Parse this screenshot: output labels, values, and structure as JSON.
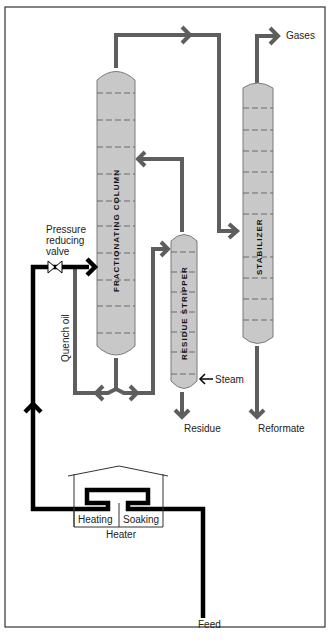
{
  "diagram": {
    "labels": {
      "gases": "Gases",
      "pressure_valve_line1": "Pressure",
      "pressure_valve_line2": "reducing",
      "pressure_valve_line3": "valve",
      "quench_oil": "Quench oil",
      "steam": "Steam",
      "residue": "Residue",
      "reformate": "Reformate",
      "heating": "Heating",
      "soaking": "Soaking",
      "heater": "Heater",
      "feed": "Feed"
    },
    "vessels": {
      "fractionating_column": "FRACTIONATING COLUMN",
      "residue_stripper": "RESIDUE STRIPPER",
      "stabilizer": "STABILIZER"
    },
    "colors": {
      "vessel_fill": "#c8c8c8",
      "grey_pipe": "#5e5e5e",
      "black_pipe": "#000000",
      "border": "#333333"
    }
  }
}
